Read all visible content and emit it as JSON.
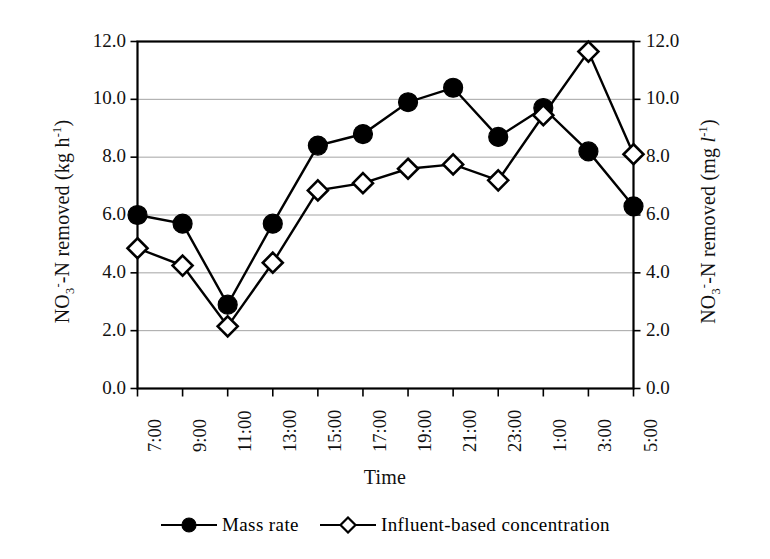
{
  "chart_data": {
    "type": "line",
    "title": "",
    "xlabel": "Time",
    "ylabel": "NO3--N removed (kg h-1)",
    "ylabel_right": "NO3--N removed (mg l-1)",
    "ylim": [
      0.0,
      12.0
    ],
    "ylim_right": [
      0.0,
      12.0
    ],
    "ytick_labels": [
      "12.0",
      "10.0",
      "8.0",
      "6.0",
      "4.0",
      "2.0",
      "0.0"
    ],
    "ytick_values": [
      12.0,
      10.0,
      8.0,
      6.0,
      4.0,
      2.0,
      0.0
    ],
    "ytick_labels_right": [
      "12.0",
      "10.0",
      "8.0",
      "6.0",
      "4.0",
      "2.0",
      "0.0"
    ],
    "grid": true,
    "grid_axis": "y",
    "legend_position": "bottom",
    "categories": [
      "7:00",
      "9:00",
      "11:00",
      "13:00",
      "15:00",
      "17:00",
      "19:00",
      "21:00",
      "23:00",
      "1:00",
      "3:00",
      "5:00"
    ],
    "series": [
      {
        "name": "Mass rate",
        "marker": "filled-circle",
        "color": "#000000",
        "values": [
          6.0,
          5.7,
          2.9,
          5.7,
          8.4,
          8.8,
          9.9,
          10.4,
          8.7,
          9.7,
          8.2,
          6.3
        ]
      },
      {
        "name": "Influent-based concentration",
        "marker": "open-diamond",
        "color": "#000000",
        "values": [
          4.85,
          4.25,
          2.15,
          4.35,
          6.85,
          7.1,
          7.6,
          7.75,
          7.2,
          9.45,
          11.65,
          8.1
        ]
      }
    ]
  },
  "axes": {
    "left_title_parts": {
      "pre": "NO",
      "sub": "3",
      "sup": "-",
      "mid": "-N removed (kg h",
      "exp": "-1",
      "post": ")"
    },
    "right_title_parts": {
      "pre": "NO",
      "sub": "3",
      "sup": "-",
      "mid": "-N removed (mg ",
      "ital": "l",
      "exp": "-1",
      "post": ")"
    },
    "x_title": "Time"
  },
  "legend": {
    "entries": [
      {
        "label": "Mass rate",
        "marker": "filled-circle"
      },
      {
        "label": "Influent-based concentration",
        "marker": "open-diamond"
      }
    ]
  }
}
